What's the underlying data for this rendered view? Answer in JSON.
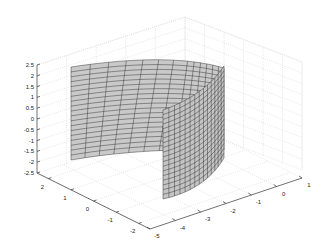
{
  "chart_data": {
    "type": "surface",
    "title": "",
    "xlabel": "",
    "ylabel": "",
    "zlabel": "",
    "x_ticks": [
      "2",
      "1",
      "0",
      "-1",
      "-2"
    ],
    "y_ticks": [
      "-5",
      "-4",
      "-3",
      "-2",
      "-1",
      "0",
      "1"
    ],
    "z_ticks": [
      "2.5",
      "2",
      "1.5",
      "1",
      "0.5",
      "0",
      "-0.5",
      "-1",
      "-1.5",
      "-2",
      "-2.5"
    ],
    "xlim": [
      -2.5,
      2.5
    ],
    "ylim": [
      -5,
      1
    ],
    "zlim": [
      -2.5,
      2.5
    ],
    "surface_z_range": [
      -2,
      2
    ],
    "grid": true,
    "face_color": "#c8c8c8",
    "edge_color": "#2a2a2a",
    "legend": null
  }
}
